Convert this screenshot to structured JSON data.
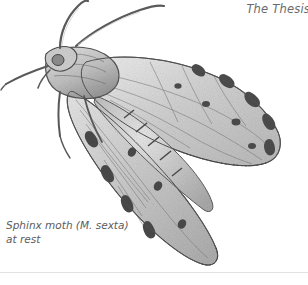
{
  "page": {
    "background_color": "#ffffff",
    "width": 308,
    "height": 285
  },
  "header": {
    "running_head": "The Thesis",
    "color": "#6a6a6a",
    "note_truncated_at_right_edge": true
  },
  "figure": {
    "name": "sphinx-moth-illustration",
    "medium": "graphite pencil drawing",
    "ink_color": "#4a4a4a",
    "shade_light": "#d8d8d8",
    "shade_mid": "#b4b4b4",
    "shade_dark": "#6e6e6e",
    "parts": [
      "left-antenna",
      "right-antenna",
      "head",
      "thorax",
      "foreleg",
      "midleg",
      "hindleg",
      "upper-forewing",
      "lower-forewing",
      "wing-margin-spots",
      "abdomen"
    ]
  },
  "caption": {
    "line1": "Sphinx moth (M. sexta)",
    "line2": "at rest",
    "color": "#5c5c5c"
  },
  "rule": {
    "color": "#e2e2e2"
  }
}
